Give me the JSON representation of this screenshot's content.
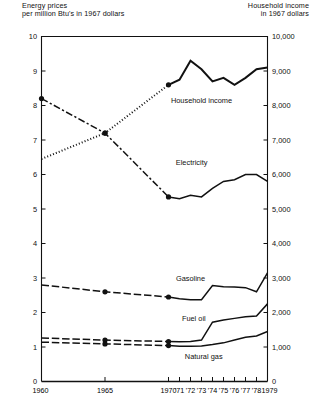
{
  "header": {
    "left": "Energy prices\nper million Btu's in 1967 dollars",
    "right": "Household income\nin 1967 dollars"
  },
  "chart_data": {
    "type": "line",
    "title": "",
    "xlabel": "",
    "ylabel": "Energy prices per million Btu's in 1967 dollars",
    "y2label": "Household income in 1967 dollars",
    "grid": false,
    "legend_position": "inline-labels",
    "xlim": [
      1960,
      1979
    ],
    "ylim": [
      0,
      10
    ],
    "y2lim": [
      0,
      10000
    ],
    "x_tick_values": [
      1960,
      1965,
      1970,
      1971,
      1972,
      1973,
      1974,
      1975,
      1976,
      1977,
      1978,
      1979
    ],
    "x_tick_labels": [
      "1960",
      "1965",
      "1970",
      "'71",
      "'72",
      "'73",
      "'74",
      "'75",
      "'76",
      "'77",
      "'78",
      "1979"
    ],
    "y_tick_values": [
      0,
      1,
      2,
      3,
      4,
      5,
      6,
      7,
      8,
      9,
      10
    ],
    "y_tick_labels": [
      "0",
      "1",
      "2",
      "3",
      "4",
      "5",
      "6",
      "7",
      "8",
      "9",
      "10"
    ],
    "y2_tick_values": [
      0,
      1000,
      2000,
      3000,
      4000,
      5000,
      6000,
      7000,
      8000,
      9000,
      10000
    ],
    "y2_tick_labels": [
      "0",
      "1,000",
      "2,000",
      "3,000",
      "4,000",
      "5,000",
      "6,000",
      "7,000",
      "8,000",
      "9,000",
      "10,000"
    ],
    "series": [
      {
        "name": "Household income",
        "axis": "right",
        "style": "dotted-then-solid",
        "label_x": 1973.0,
        "label_y": 8150,
        "markers_at": [
          1965,
          1970
        ],
        "x": [
          1960,
          1965,
          1970,
          1971,
          1972,
          1973,
          1974,
          1975,
          1976,
          1977,
          1978,
          1979
        ],
        "values": [
          6450,
          7200,
          8600,
          8750,
          9300,
          9050,
          8700,
          8800,
          8600,
          8800,
          9050,
          9100
        ]
      },
      {
        "name": "Electricity",
        "axis": "left",
        "style": "dash-dot-then-solid",
        "label_x": 1972.1,
        "label_y": 6.35,
        "markers_at": [
          1960,
          1965,
          1970
        ],
        "x": [
          1960,
          1965,
          1970,
          1971,
          1972,
          1973,
          1974,
          1975,
          1976,
          1977,
          1978,
          1979
        ],
        "values": [
          8.2,
          7.2,
          5.35,
          5.3,
          5.4,
          5.35,
          5.6,
          5.8,
          5.85,
          6.0,
          6.0,
          5.8
        ]
      },
      {
        "name": "Gasoline",
        "axis": "left",
        "style": "dashed-then-solid",
        "label_x": 1972.0,
        "label_y": 3.0,
        "markers_at": [
          1965,
          1970
        ],
        "x": [
          1960,
          1965,
          1970,
          1971,
          1972,
          1973,
          1974,
          1975,
          1976,
          1977,
          1978,
          1979
        ],
        "values": [
          2.8,
          2.6,
          2.45,
          2.4,
          2.37,
          2.37,
          2.78,
          2.75,
          2.74,
          2.72,
          2.6,
          3.15
        ]
      },
      {
        "name": "Fuel oil",
        "axis": "left",
        "style": "dashed-then-solid",
        "label_x": 1972.3,
        "label_y": 1.82,
        "markers_at": [
          1965,
          1970
        ],
        "x": [
          1960,
          1965,
          1970,
          1971,
          1972,
          1973,
          1974,
          1975,
          1976,
          1977,
          1978,
          1979
        ],
        "values": [
          1.26,
          1.2,
          1.16,
          1.15,
          1.16,
          1.2,
          1.72,
          1.78,
          1.83,
          1.88,
          1.9,
          2.25
        ]
      },
      {
        "name": "Natural gas",
        "axis": "left",
        "style": "dashed-then-solid",
        "label_x": 1973.2,
        "label_y": 0.72,
        "markers_at": [
          1965,
          1970
        ],
        "x": [
          1960,
          1965,
          1970,
          1971,
          1972,
          1973,
          1974,
          1975,
          1976,
          1977,
          1978,
          1979
        ],
        "values": [
          1.14,
          1.09,
          1.04,
          1.02,
          1.02,
          1.03,
          1.07,
          1.12,
          1.2,
          1.28,
          1.32,
          1.45
        ]
      }
    ]
  }
}
